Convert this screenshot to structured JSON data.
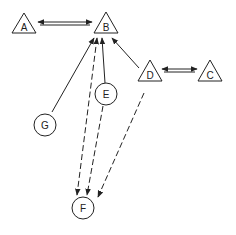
{
  "diagram": {
    "nodes": [
      {
        "id": "A",
        "label": "A",
        "shape": "triangle",
        "cx": 24,
        "cy": 24
      },
      {
        "id": "B",
        "label": "B",
        "shape": "triangle",
        "cx": 106,
        "cy": 24
      },
      {
        "id": "D",
        "label": "D",
        "shape": "triangle",
        "cx": 150,
        "cy": 71
      },
      {
        "id": "C",
        "label": "C",
        "shape": "triangle",
        "cx": 210,
        "cy": 71
      },
      {
        "id": "E",
        "label": "E",
        "shape": "circle",
        "cx": 106,
        "cy": 94
      },
      {
        "id": "G",
        "label": "G",
        "shape": "circle",
        "cx": 45,
        "cy": 125
      },
      {
        "id": "F",
        "label": "F",
        "shape": "circle",
        "cx": 83,
        "cy": 210
      }
    ],
    "edges": [
      {
        "from": "A",
        "to": "B",
        "style": "double",
        "direction": "both"
      },
      {
        "from": "D",
        "to": "C",
        "style": "double",
        "direction": "both"
      },
      {
        "from": "G",
        "to": "B",
        "style": "solid",
        "direction": "forward"
      },
      {
        "from": "E",
        "to": "B",
        "style": "solid",
        "direction": "forward"
      },
      {
        "from": "D",
        "to": "B",
        "style": "solid",
        "direction": "forward"
      },
      {
        "from": "B",
        "to": "F",
        "style": "dashed",
        "direction": "both"
      },
      {
        "from": "E",
        "to": "F",
        "style": "dashed",
        "direction": "forward"
      },
      {
        "from": "D",
        "to": "F",
        "style": "dashed",
        "direction": "forward"
      }
    ],
    "colors": {
      "stroke": "#222222",
      "background": "#ffffff"
    }
  }
}
